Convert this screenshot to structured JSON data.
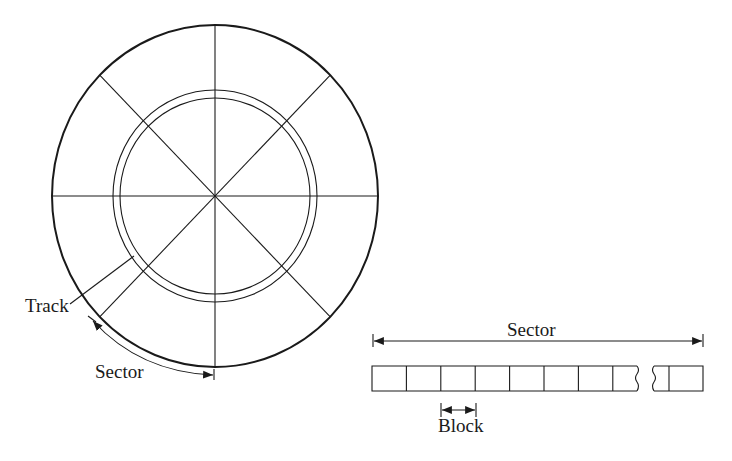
{
  "disk": {
    "radial_divisions": 8,
    "labels": {
      "track": "Track",
      "sector": "Sector"
    }
  },
  "strip": {
    "sector_label": "Sector",
    "block_label": "Block",
    "blocks_before_break": 8,
    "blocks_after_break": 2
  },
  "colors": {
    "line": "#1a1a1a",
    "background": "#ffffff"
  }
}
